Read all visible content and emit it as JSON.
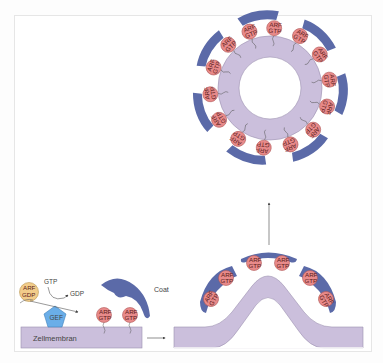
{
  "diagram": {
    "type": "biology-pathway",
    "title": "",
    "labels": {
      "membrane": "Zellmembran",
      "coat": "Coat",
      "gef": "GEF",
      "gtp_in": "GTP",
      "gdp_out": "GDP"
    },
    "molecules": {
      "arf_gdp": {
        "line1": "ARF",
        "line2": "GDP",
        "color": "#f2cc8a"
      },
      "arf_gtp": {
        "line1": "ARF",
        "line2": "GTP",
        "color": "#e88a8a"
      }
    },
    "colors": {
      "membrane": "#cbbfdc",
      "membrane_stroke": "#9c90b0",
      "coat": "#5b6aa8",
      "gef": "#6aaee8",
      "arf_gtp": "#e88a8a",
      "arf_gdp": "#f2cc8a",
      "arrow": "#555555"
    },
    "stages": [
      {
        "id": "flat-membrane",
        "description": "ARF-GDP exchanged to ARF-GTP by GEF at Zellmembran; Coat recruited"
      },
      {
        "id": "budding",
        "description": "Membrane curves with 6 ARF-GTP and 3 coat units"
      },
      {
        "id": "vesicle",
        "description": "Closed coated vesicle with 14 ARF-GTP and 7 coat units"
      }
    ]
  }
}
